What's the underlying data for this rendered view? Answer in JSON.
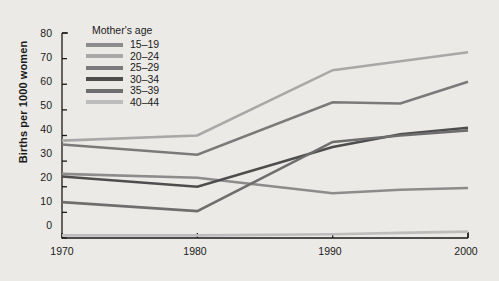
{
  "chart_data": {
    "type": "line",
    "title": "",
    "subtitle": "",
    "xlabel": "",
    "ylabel": "Births per 1000 women",
    "x": [
      1970,
      1980,
      1990,
      1995,
      2000
    ],
    "xticks": [
      "1970",
      "1980",
      "1990",
      "2000"
    ],
    "xtick_values": [
      1970,
      1980,
      1990,
      2000
    ],
    "xlim": [
      1970,
      2000
    ],
    "yticks": [
      "0",
      "10",
      "20",
      "30",
      "40",
      "50",
      "60",
      "70",
      "80"
    ],
    "ytick_values": [
      0,
      10,
      20,
      30,
      40,
      50,
      60,
      70,
      80
    ],
    "ylim": [
      0,
      80
    ],
    "grid": false,
    "legend_position": "top-left-inside",
    "legend_title": "Mother's age",
    "series": [
      {
        "name": "15–19",
        "color": "#8c8c8c",
        "values": [
          25.0,
          23.5,
          17.5,
          18.8,
          19.5
        ]
      },
      {
        "name": "20–24",
        "color": "#a8a8a8",
        "values": [
          38.0,
          40.0,
          65.5,
          69.0,
          72.5
        ]
      },
      {
        "name": "25–29",
        "color": "#7a7a7a",
        "values": [
          36.5,
          32.5,
          53.0,
          52.5,
          61.0
        ]
      },
      {
        "name": "30–34",
        "color": "#4d4d4d",
        "values": [
          24.0,
          20.0,
          35.5,
          40.5,
          43.0
        ]
      },
      {
        "name": "35–39",
        "color": "#6e6e6e",
        "values": [
          14.0,
          10.5,
          37.5,
          40.0,
          42.0
        ]
      },
      {
        "name": "40–44",
        "color": "#bdbdbd",
        "values": [
          1.0,
          1.0,
          1.5,
          2.0,
          2.5
        ]
      }
    ]
  }
}
